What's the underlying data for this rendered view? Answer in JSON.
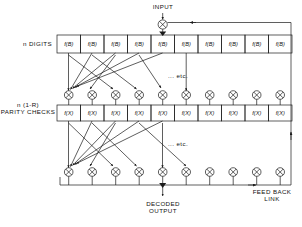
{
  "diagram": {
    "title_labels": {
      "input": "INPUT",
      "digits_row": "n DIGITS",
      "parity_row_line1": "n (1-R)",
      "parity_row_line2": "PARITY CHECKS",
      "etc_upper": "... etc.",
      "etc_lower": "... etc.",
      "decoded_line1": "DECODED",
      "decoded_line2": "OUTPUT",
      "feedback_line1": "FEED BACK",
      "feedback_line2": "LINK"
    },
    "digit_boxes": {
      "count": 10,
      "label": "f(B)",
      "labels": [
        "f(B)",
        "f(B)",
        "f(B)",
        "f(B)",
        "f(B)",
        "f(B)",
        "f(B)",
        "f(B)",
        "f(B)",
        "f(B)"
      ]
    },
    "parity_boxes": {
      "count": 10,
      "label": "f(X)",
      "labels": [
        "f(X)",
        "f(X)",
        "f(X)",
        "f(X)",
        "f(X)",
        "f(X)",
        "f(X)",
        "f(X)",
        "f(X)",
        "f(X)"
      ]
    },
    "xor_gates": {
      "upper_row_count": 10,
      "lower_row_count": 10,
      "input_gate_count": 1,
      "symbol": "xor-circle-plus"
    },
    "colors": {
      "line": "#1a1a1a",
      "text": "#111111",
      "background": "#ffffff"
    }
  }
}
